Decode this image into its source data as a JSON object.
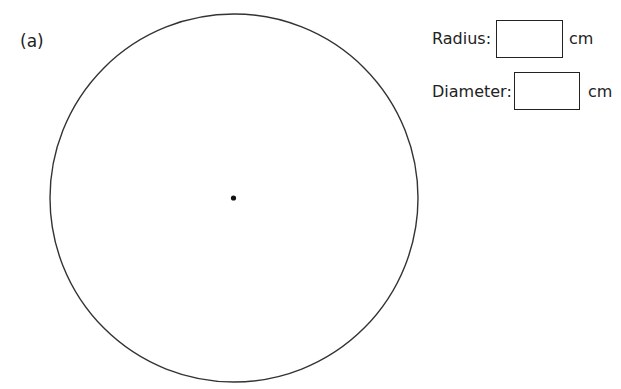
{
  "question": {
    "label": "(a)"
  },
  "figure": {
    "shape": "circle",
    "center_marker": "dot",
    "stroke_color": "#333333"
  },
  "answers": {
    "radius": {
      "label": "Radius:",
      "value": "",
      "unit": "cm"
    },
    "diameter": {
      "label": "Diameter:",
      "value": "",
      "unit": "cm"
    }
  }
}
